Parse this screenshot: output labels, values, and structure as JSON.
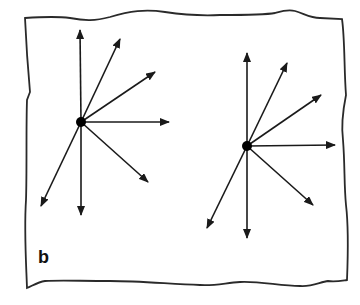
{
  "figure": {
    "panel_label": "b",
    "label_pos": {
      "x": 38,
      "y": 247,
      "size": 18
    },
    "stroke_color": "#1a1a1a",
    "border_color": "#2a2a2a",
    "background": "#ffffff",
    "border_path": "M25,18 C40,17 55,16 70,18 C85,21 95,21 110,17 C130,11 145,9 165,12 C185,15 200,16 220,15 C245,15 265,15 275,13 C282,11 288,9 295,11 C305,14 310,18 320,18 L342,19 C345,40 344,70 346,95 C343,110 341,125 343,140 C345,165 344,185 346,205 C349,230 348,255 347,280 C340,281 335,282 328,281 C320,282 312,287 300,286 C280,286 260,281 240,282 C225,283 215,286 200,285 C170,284 140,281 110,281 C80,281 60,280 45,281 C38,282 32,286 27,288 C26,260 24,230 26,200 C27,170 26,130 27,100 L30,92 C28,70 26,40 25,18 Z"
  },
  "chart_data": {
    "type": "diagram",
    "title": "",
    "diagrams": [
      {
        "name": "left-vector-fan",
        "origin": {
          "x": 81,
          "y": 122
        },
        "arrows": [
          {
            "direction": "up",
            "tip": {
              "x": 80,
              "y": 30
            }
          },
          {
            "direction": "up-right-steep",
            "tip": {
              "x": 120,
              "y": 39
            }
          },
          {
            "direction": "up-right-shallow",
            "tip": {
              "x": 155,
              "y": 72
            }
          },
          {
            "direction": "right",
            "tip": {
              "x": 169,
              "y": 122
            }
          },
          {
            "direction": "down-right",
            "tip": {
              "x": 148,
              "y": 182
            }
          },
          {
            "direction": "down",
            "tip": {
              "x": 81,
              "y": 215
            }
          },
          {
            "direction": "down-left",
            "tip": {
              "x": 41,
              "y": 206
            }
          }
        ]
      },
      {
        "name": "right-vector-fan",
        "origin": {
          "x": 247,
          "y": 146
        },
        "arrows": [
          {
            "direction": "up",
            "tip": {
              "x": 247,
              "y": 53
            }
          },
          {
            "direction": "up-right-steep",
            "tip": {
              "x": 287,
              "y": 63
            }
          },
          {
            "direction": "up-right-shallow",
            "tip": {
              "x": 321,
              "y": 95
            }
          },
          {
            "direction": "right",
            "tip": {
              "x": 335,
              "y": 145
            }
          },
          {
            "direction": "down-right",
            "tip": {
              "x": 313,
              "y": 205
            }
          },
          {
            "direction": "down",
            "tip": {
              "x": 247,
              "y": 238
            }
          },
          {
            "direction": "down-left",
            "tip": {
              "x": 207,
              "y": 228
            }
          }
        ]
      }
    ]
  }
}
